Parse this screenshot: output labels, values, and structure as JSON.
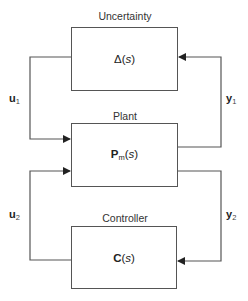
{
  "diagram": {
    "blocks": {
      "uncertainty": {
        "title": "Uncertainty",
        "symbol": "Δ",
        "arg_open": "(",
        "arg": "s",
        "arg_close": ")"
      },
      "plant": {
        "title": "Plant",
        "symbol": "P",
        "subscript": "m",
        "arg_open": "(",
        "arg": "s",
        "arg_close": ")"
      },
      "controller": {
        "title": "Controller",
        "symbol": "C",
        "arg_open": "(",
        "arg": "s",
        "arg_close": ")"
      }
    },
    "signals": {
      "u1": {
        "symbol": "u",
        "subscript": "1"
      },
      "y1": {
        "symbol": "y",
        "subscript": "1"
      },
      "u2": {
        "symbol": "u",
        "subscript": "2"
      },
      "y2": {
        "symbol": "y",
        "subscript": "2"
      }
    },
    "connections": [
      {
        "from": "uncertainty",
        "to": "plant",
        "signal": "u1"
      },
      {
        "from": "plant",
        "to": "uncertainty",
        "signal": "y1"
      },
      {
        "from": "plant",
        "to": "controller",
        "signal": "y2"
      },
      {
        "from": "controller",
        "to": "plant",
        "signal": "u2"
      }
    ],
    "colors": {
      "line": "#555555",
      "text": "#222222"
    }
  }
}
